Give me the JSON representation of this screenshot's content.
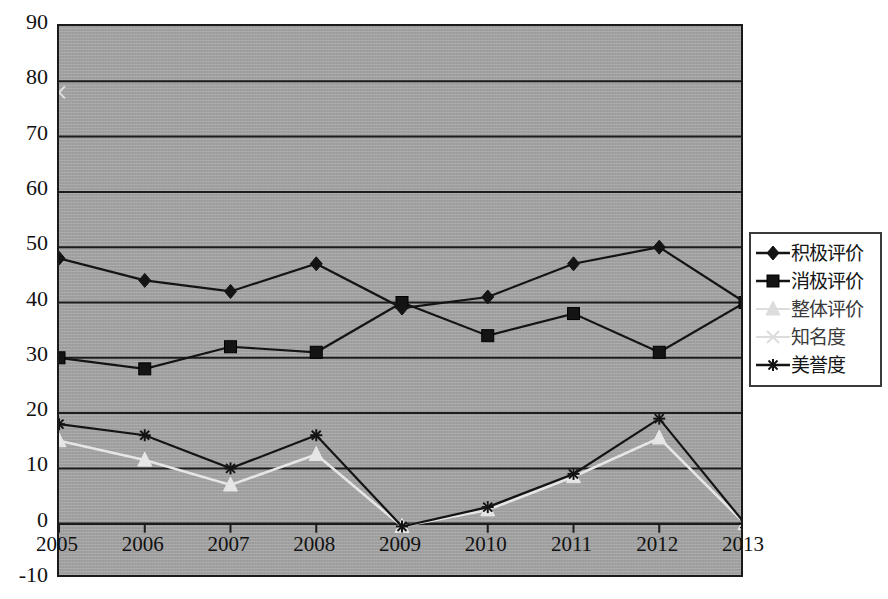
{
  "chart_data": {
    "type": "line",
    "title": "",
    "subtitle": "",
    "xlabel": "",
    "ylabel": "",
    "categories": [
      "2005",
      "2006",
      "2007",
      "2008",
      "2009",
      "2010",
      "2011",
      "2012",
      "2013"
    ],
    "x_tick_labels": [
      "2005",
      "2006",
      "2007",
      "2008",
      "2009",
      "2010",
      "2011",
      "2012",
      "2013"
    ],
    "y_tick_labels": [
      "90",
      "80",
      "70",
      "60",
      "50",
      "40",
      "30",
      "20",
      "10",
      "0",
      "-10"
    ],
    "y_ticks": [
      90,
      80,
      70,
      60,
      50,
      40,
      30,
      20,
      10,
      0,
      -10
    ],
    "ylim": [
      -10,
      90
    ],
    "grid": true,
    "grid_axis": "y",
    "legend_position": "right",
    "plot_background": "#a9a9a9",
    "series": [
      {
        "name": "积极评价",
        "marker": "diamond",
        "color": "#141414",
        "values": [
          48,
          44,
          42,
          47,
          39,
          41,
          47,
          50,
          40
        ]
      },
      {
        "name": "消极评价",
        "marker": "square",
        "color": "#141414",
        "values": [
          30,
          28,
          32,
          31,
          40,
          34,
          38,
          31,
          40
        ]
      },
      {
        "name": "整体评价",
        "marker": "triangle",
        "color": "#e6e6e6",
        "values": [
          15,
          11.5,
          7,
          12.5,
          -0.5,
          2.5,
          8.5,
          15.5,
          0
        ]
      },
      {
        "name": "知名度",
        "marker": "x",
        "color": "#e0e0e0",
        "values": [
          78,
          null,
          null,
          null,
          null,
          null,
          null,
          null,
          null
        ]
      },
      {
        "name": "美誉度",
        "marker": "star",
        "color": "#141414",
        "values": [
          18,
          16,
          10,
          16,
          -0.5,
          3,
          9,
          19,
          0
        ]
      }
    ]
  },
  "legend": {
    "items": [
      {
        "label": "积极评价",
        "marker": "diamond-marker",
        "tone": "dark"
      },
      {
        "label": "消极评价",
        "marker": "square-marker",
        "tone": "dark"
      },
      {
        "label": "整体评价",
        "marker": "triangle-marker",
        "tone": "light"
      },
      {
        "label": "知名度",
        "marker": "x-marker",
        "tone": "light"
      },
      {
        "label": "美誉度",
        "marker": "star-marker",
        "tone": "dark"
      }
    ]
  }
}
